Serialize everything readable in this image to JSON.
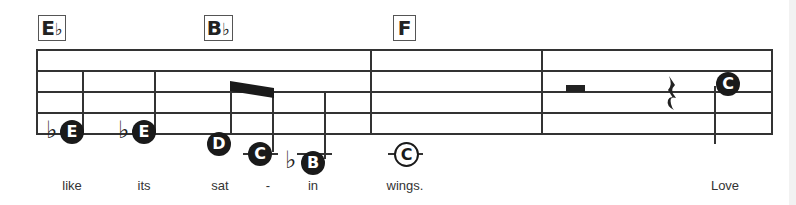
{
  "chords": [
    {
      "root": "E",
      "accidental": "♭"
    },
    {
      "root": "B",
      "accidental": "♭"
    },
    {
      "root": "F",
      "accidental": ""
    }
  ],
  "notes": [
    {
      "name": "E",
      "accidental": "♭",
      "filled": true
    },
    {
      "name": "E",
      "accidental": "♭",
      "filled": true
    },
    {
      "name": "D",
      "accidental": "",
      "filled": true
    },
    {
      "name": "C",
      "accidental": "",
      "filled": true
    },
    {
      "name": "B",
      "accidental": "♭",
      "filled": true
    },
    {
      "name": "C",
      "accidental": "",
      "filled": false
    },
    {
      "name": "C",
      "accidental": "",
      "filled": true
    }
  ],
  "lyrics": [
    "like",
    "its",
    "sat",
    "-",
    "in",
    "wings.",
    "Love"
  ]
}
